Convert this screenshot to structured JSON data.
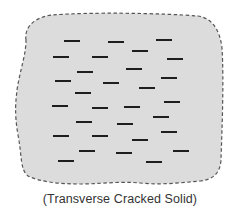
{
  "figure": {
    "caption": "(Transverse Cracked Solid)",
    "fill_color": "#dcdcdc",
    "outline_color": "#555555",
    "crack_color": "#1e1e1e",
    "outline_path": "M 26 40 C 24 26, 36 17, 52 15 C 90 12, 160 13, 198 16 C 212 18, 220 30, 222 48 C 224 80, 222 130, 221 160 C 220 174, 212 180, 200 181 C 180 183, 160 185, 140 183 C 120 181, 100 184, 80 184 C 60 184, 40 182, 28 176 C 20 170, 22 155, 18 135 C 14 112, 16 100, 17 90 C 20 70, 26 55, 26 40 Z",
    "crack_length": 16,
    "crack_thickness": 2,
    "cracks": [
      {
        "x": 64,
        "y": 41
      },
      {
        "x": 108,
        "y": 42
      },
      {
        "x": 156,
        "y": 40
      },
      {
        "x": 132,
        "y": 51
      },
      {
        "x": 53,
        "y": 57
      },
      {
        "x": 92,
        "y": 57
      },
      {
        "x": 167,
        "y": 59
      },
      {
        "x": 77,
        "y": 72
      },
      {
        "x": 126,
        "y": 69
      },
      {
        "x": 55,
        "y": 81
      },
      {
        "x": 103,
        "y": 83
      },
      {
        "x": 161,
        "y": 78
      },
      {
        "x": 139,
        "y": 88
      },
      {
        "x": 75,
        "y": 93
      },
      {
        "x": 52,
        "y": 106
      },
      {
        "x": 92,
        "y": 108
      },
      {
        "x": 124,
        "y": 107
      },
      {
        "x": 164,
        "y": 102
      },
      {
        "x": 76,
        "y": 122
      },
      {
        "x": 117,
        "y": 124
      },
      {
        "x": 153,
        "y": 117
      },
      {
        "x": 53,
        "y": 136
      },
      {
        "x": 92,
        "y": 136
      },
      {
        "x": 161,
        "y": 132
      },
      {
        "x": 132,
        "y": 140
      },
      {
        "x": 79,
        "y": 151
      },
      {
        "x": 116,
        "y": 153
      },
      {
        "x": 173,
        "y": 151
      },
      {
        "x": 58,
        "y": 161
      },
      {
        "x": 146,
        "y": 162
      }
    ]
  }
}
